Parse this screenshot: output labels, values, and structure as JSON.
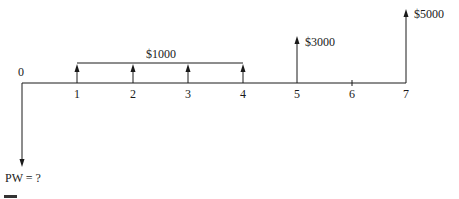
{
  "diagram": {
    "type": "cash-flow-diagram",
    "periods": [
      "0",
      "1",
      "2",
      "3",
      "4",
      "5",
      "6",
      "7"
    ],
    "annuity": {
      "label": "$1000",
      "from_period": 1,
      "to_period": 4,
      "direction": "up"
    },
    "single_flows": [
      {
        "period": 5,
        "label": "$3000",
        "direction": "up"
      },
      {
        "period": 7,
        "label": "$5000",
        "direction": "up"
      }
    ],
    "present_worth": {
      "period": 0,
      "label": "PW = ?",
      "direction": "down"
    }
  }
}
